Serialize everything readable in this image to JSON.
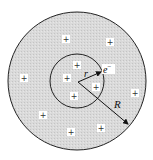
{
  "diagram": {
    "title": "",
    "outer_sphere": {
      "cx": 77,
      "cy": 81,
      "r": 69,
      "fill": "#d6d6d6",
      "stroke": "#222222"
    },
    "inner_sphere": {
      "cx": 77,
      "cy": 81,
      "r": 27,
      "stroke": "#222222"
    },
    "charges": [
      {
        "x": 66,
        "y": 39,
        "symbol": "+"
      },
      {
        "x": 110,
        "y": 42,
        "symbol": "+"
      },
      {
        "x": 77,
        "y": 65,
        "symbol": "+"
      },
      {
        "x": 67,
        "y": 78,
        "symbol": "+"
      },
      {
        "x": 24,
        "y": 78,
        "symbol": "+"
      },
      {
        "x": 96,
        "y": 87,
        "symbol": "+"
      },
      {
        "x": 135,
        "y": 93,
        "symbol": "+"
      },
      {
        "x": 74,
        "y": 96,
        "symbol": "+"
      },
      {
        "x": 43,
        "y": 115,
        "symbol": "+"
      },
      {
        "x": 101,
        "y": 128,
        "symbol": "+"
      },
      {
        "x": 71,
        "y": 132,
        "symbol": "+"
      }
    ],
    "labels": {
      "small_radius": "r",
      "large_radius": "R",
      "electron": "e",
      "electron_charge": "−"
    }
  }
}
